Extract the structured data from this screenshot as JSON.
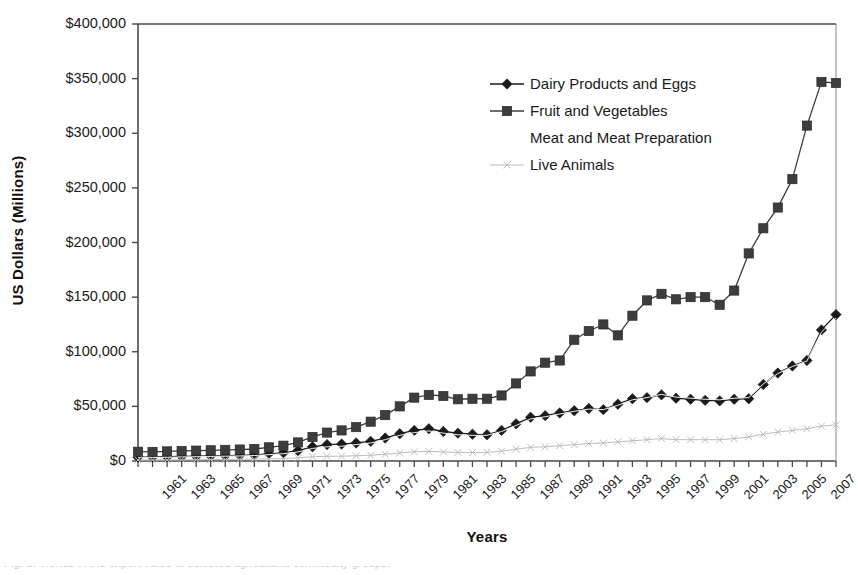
{
  "chart_data": {
    "type": "line",
    "title": "",
    "xlabel": "Years",
    "ylabel": "US Dollars (Millions)",
    "ylim": [
      0,
      400000
    ],
    "ytick_values": [
      0,
      50000,
      100000,
      150000,
      200000,
      250000,
      300000,
      350000,
      400000
    ],
    "ytick_labels": [
      "$0",
      "$50,000",
      "$100,000",
      "$150,000",
      "$200,000",
      "$250,000",
      "$300,000",
      "$350,000",
      "$400,000"
    ],
    "grid": false,
    "legend_position": "upper-center-right",
    "x": [
      1961,
      1962,
      1963,
      1964,
      1965,
      1966,
      1967,
      1968,
      1969,
      1970,
      1971,
      1972,
      1973,
      1974,
      1975,
      1976,
      1977,
      1978,
      1979,
      1980,
      1981,
      1982,
      1983,
      1984,
      1985,
      1986,
      1987,
      1988,
      1989,
      1990,
      1991,
      1992,
      1993,
      1994,
      1995,
      1996,
      1997,
      1998,
      1999,
      2000,
      2001,
      2002,
      2003,
      2004,
      2005,
      2006,
      2007,
      2008,
      2009
    ],
    "xtick_labels": [
      "1961",
      "1963",
      "1965",
      "1967",
      "1969",
      "1971",
      "1973",
      "1975",
      "1977",
      "1979",
      "1981",
      "1983",
      "1985",
      "1987",
      "1989",
      "1991",
      "1993",
      "1995",
      "1997",
      "1999",
      "2001",
      "2003",
      "2005",
      "2007"
    ],
    "series": [
      {
        "name": "Dairy Products and Eggs",
        "marker": "diamond",
        "color": "#1a1a1a",
        "values": [
          3500,
          3600,
          3900,
          4200,
          4400,
          4700,
          5000,
          5200,
          5600,
          6500,
          7500,
          9500,
          13000,
          15000,
          15500,
          16500,
          18000,
          21000,
          25000,
          28000,
          29500,
          27000,
          25500,
          24500,
          24000,
          28000,
          34000,
          40000,
          41500,
          44000,
          46000,
          48000,
          47000,
          52000,
          57000,
          58000,
          60500,
          57500,
          56500,
          55500,
          55000,
          56500,
          57000,
          70000,
          80500,
          87000,
          92000,
          120000,
          134000
        ]
      },
      {
        "name": "Fruit and Vegetables",
        "marker": "square",
        "color": "#3d3d3d",
        "values": [
          8500,
          8300,
          8800,
          9200,
          9500,
          9800,
          10200,
          10500,
          11000,
          12500,
          14000,
          17000,
          22000,
          26000,
          28000,
          31000,
          36000,
          42000,
          50000,
          58000,
          60500,
          59500,
          56500,
          57000,
          57000,
          60000,
          71000,
          82000,
          90000,
          92000,
          111000,
          119000,
          125000,
          115000,
          133000,
          147000,
          153000,
          148000,
          150000,
          150000,
          143000,
          156000,
          190000,
          213000,
          232000,
          258000,
          307000,
          347000,
          346000
        ]
      },
      {
        "name": "Meat and Meat Preparation",
        "marker": "none",
        "color": "#f2f2f2",
        "values": [
          3000,
          3100,
          3400,
          3700,
          3900,
          4200,
          4400,
          4600,
          5000,
          5800,
          6700,
          8300,
          11500,
          13000,
          13500,
          15000,
          16500,
          19500,
          23500,
          26000,
          27500,
          25500,
          24000,
          23500,
          23500,
          27000,
          32500,
          38500,
          40500,
          43000,
          45500,
          47500,
          47000,
          51000,
          56000,
          58000,
          61000,
          58500,
          57500,
          56500,
          56000,
          57500,
          58000,
          70500,
          80000,
          86500,
          91500,
          118000,
          131000
        ]
      },
      {
        "name": "Live Animals",
        "marker": "x",
        "color": "#bdbdbd",
        "values": [
          900,
          950,
          1000,
          1100,
          1200,
          1300,
          1400,
          1500,
          1700,
          2000,
          2300,
          2900,
          3900,
          4300,
          4400,
          4800,
          5300,
          6200,
          7400,
          8400,
          8800,
          8300,
          7900,
          7800,
          7900,
          9000,
          10800,
          12500,
          13000,
          14000,
          15000,
          16000,
          16500,
          17500,
          18500,
          19500,
          20500,
          19500,
          19500,
          19500,
          19500,
          20500,
          22000,
          24500,
          26500,
          28000,
          29500,
          32000,
          33000
        ]
      }
    ]
  },
  "caption": {
    "clipped_line": "Fig. 1. Trends in the export value of selected agricultural commodity groups."
  }
}
